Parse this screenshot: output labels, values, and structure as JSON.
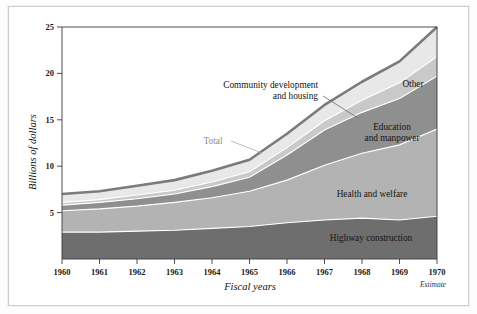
{
  "chart_data": {
    "type": "area",
    "title": "",
    "subtitle": "",
    "xlabel": "Fiscal years",
    "ylabel": "Billions of dollars",
    "x": [
      1960,
      1961,
      1962,
      1963,
      1964,
      1965,
      1966,
      1967,
      1968,
      1969,
      1970
    ],
    "categories": [
      "1960",
      "1961",
      "1962",
      "1963",
      "1964",
      "1965",
      "1966",
      "1967",
      "1968",
      "1969",
      "1970"
    ],
    "xlim": [
      1960,
      1970
    ],
    "ylim": [
      0,
      25
    ],
    "ytick_labels": [
      "5",
      "10",
      "15",
      "20",
      "25"
    ],
    "ytick_values": [
      5,
      10,
      15,
      20,
      25
    ],
    "grid": false,
    "legend_position": "inline-annotations",
    "stacked": true,
    "series": [
      {
        "name": "Highway construction",
        "color": "#6e6e6e",
        "values": [
          2.9,
          2.9,
          3.0,
          3.1,
          3.3,
          3.5,
          3.9,
          4.2,
          4.4,
          4.2,
          4.6
        ]
      },
      {
        "name": "Health and welfare",
        "color": "#b3b3b3",
        "values": [
          2.3,
          2.5,
          2.7,
          3.0,
          3.3,
          3.8,
          4.6,
          5.9,
          7.0,
          8.1,
          9.4
        ]
      },
      {
        "name": "Education and manpower",
        "color": "#8f8f8f",
        "values": [
          0.6,
          0.7,
          0.8,
          0.9,
          1.2,
          1.5,
          2.7,
          3.8,
          4.4,
          5.0,
          5.7
        ]
      },
      {
        "name": "Community development and housing",
        "color": "#c9c9c9",
        "values": [
          0.3,
          0.3,
          0.4,
          0.4,
          0.5,
          0.6,
          0.8,
          1.0,
          1.3,
          1.7,
          2.1
        ]
      },
      {
        "name": "Other",
        "color": "#e8e8e8",
        "values": [
          0.9,
          0.9,
          1.0,
          1.1,
          1.2,
          1.3,
          1.5,
          1.7,
          2.0,
          2.3,
          3.2
        ]
      }
    ],
    "total": {
      "name": "Total",
      "color": "#7b7b7b",
      "values": [
        7.0,
        7.3,
        7.9,
        8.5,
        9.5,
        10.7,
        13.5,
        16.6,
        19.1,
        21.3,
        25.0
      ]
    },
    "annotations": [
      {
        "text": "Other",
        "id": "other-label"
      },
      {
        "text": "Community development",
        "id": "community-label-line1"
      },
      {
        "text": "and housing",
        "id": "community-label-line2"
      },
      {
        "text": "Education",
        "id": "education-label-line1"
      },
      {
        "text": "and manpower",
        "id": "education-label-line2"
      },
      {
        "text": "Health and welfare",
        "id": "health-label"
      },
      {
        "text": "Highway construction",
        "id": "highway-label"
      },
      {
        "text": "Total",
        "id": "total-label"
      },
      {
        "text": "Estimate",
        "id": "estimate-note"
      }
    ],
    "notes": {
      "estimate": "Estimate",
      "estimate_applies_to": "1970"
    }
  },
  "labels": {
    "y_axis_title": "Billions of dollars",
    "x_axis_title": "Fiscal years",
    "estimate": "Estimate",
    "total": "Total",
    "other": "Other",
    "community_line1": "Community development",
    "community_line2": "and housing",
    "education_line1": "Education",
    "education_line2": "and manpower",
    "health": "Health and welfare",
    "highway": "Highway construction"
  },
  "ticks": {
    "y": [
      "25",
      "20",
      "15",
      "10",
      "5"
    ],
    "x": [
      "1960",
      "1961",
      "1962",
      "1963",
      "1964",
      "1965",
      "1966",
      "1967",
      "1968",
      "1969",
      "1970"
    ]
  },
  "colors": {
    "highway": "#6e6e6e",
    "health": "#b3b3b3",
    "education": "#8f8f8f",
    "community": "#c9c9c9",
    "other": "#e8e8e8",
    "total_line": "#7b7b7b",
    "axis": "#3a3a3a",
    "frame": "#cdcdcd",
    "background": "#ffffff"
  }
}
